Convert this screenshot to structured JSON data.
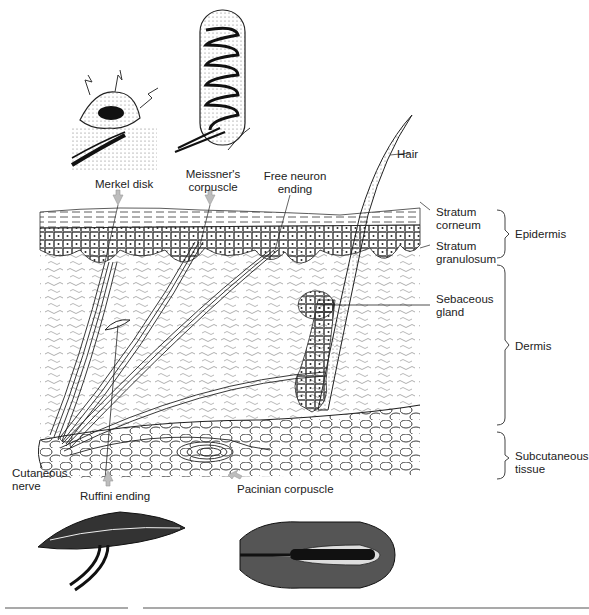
{
  "figure": {
    "labels": {
      "merkel": "Merkel disk",
      "meissner_1": "Meissner's",
      "meissner_2": "corpuscle",
      "free_1": "Free neuron",
      "free_2": "ending",
      "hair": "Hair",
      "corneum_1": "Stratum",
      "corneum_2": "corneum",
      "granulosum_1": "Stratum",
      "granulosum_2": "granulosum",
      "sebaceous_1": "Sebaceous",
      "sebaceous_2": "gland",
      "epidermis": "Epidermis",
      "dermis": "Dermis",
      "subcut_1": "Subcutaneous",
      "subcut_2": "tissue",
      "cutaneous_1": "Cutaneous",
      "cutaneous_2": "nerve",
      "ruffini": "Ruffini ending",
      "pacinian": "Pacinian corpuscle"
    },
    "colors": {
      "ink": "#1a1a1a",
      "arrow": "#bdbdbd",
      "rule": "#555555"
    }
  }
}
